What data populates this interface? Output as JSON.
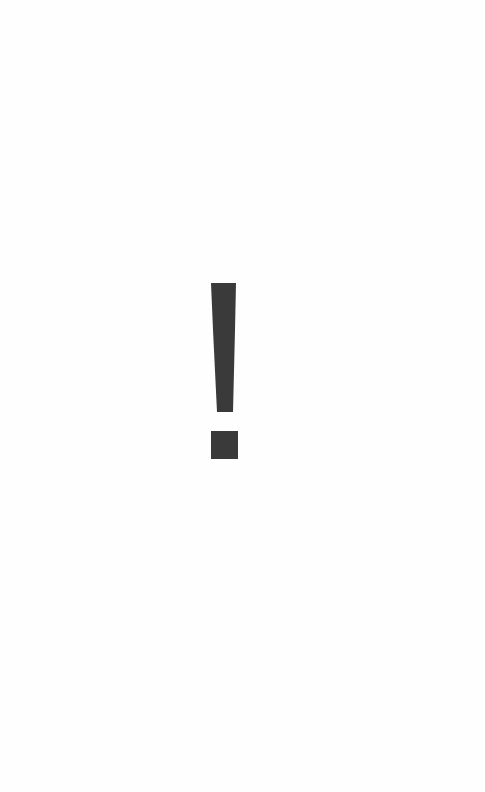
{
  "page": {
    "background_color": "#fefefe"
  },
  "glyph": {
    "icon": "exclamation-mark-icon",
    "color": "#3a3a3a"
  }
}
